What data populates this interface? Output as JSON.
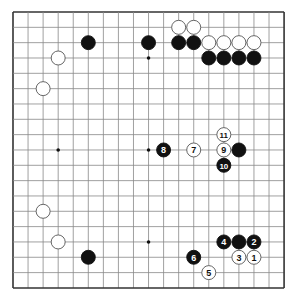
{
  "board": {
    "size": 19,
    "origin": {
      "x": 13,
      "y": 12
    },
    "spacing": {
      "x": 15.06,
      "y": 15.33
    },
    "colors": {
      "background": "#ffffff",
      "line": "#888888",
      "border": "#333333",
      "black": "#111111",
      "white": "#ffffff",
      "white_outline": "#555555"
    },
    "star_points": [
      [
        3,
        3
      ],
      [
        9,
        3
      ],
      [
        15,
        3
      ],
      [
        3,
        9
      ],
      [
        9,
        9
      ],
      [
        15,
        9
      ],
      [
        3,
        15
      ],
      [
        9,
        15
      ],
      [
        15,
        15
      ]
    ],
    "stones": [
      {
        "col": 5,
        "row": 2,
        "color": "black",
        "label": ""
      },
      {
        "col": 9,
        "row": 2,
        "color": "black",
        "label": ""
      },
      {
        "col": 3,
        "row": 3,
        "color": "white",
        "label": ""
      },
      {
        "col": 2,
        "row": 5,
        "color": "white",
        "label": ""
      },
      {
        "col": 11,
        "row": 1,
        "color": "white",
        "label": ""
      },
      {
        "col": 12,
        "row": 1,
        "color": "white",
        "label": ""
      },
      {
        "col": 11,
        "row": 2,
        "color": "black",
        "label": ""
      },
      {
        "col": 12,
        "row": 2,
        "color": "black",
        "label": ""
      },
      {
        "col": 13,
        "row": 2,
        "color": "white",
        "label": ""
      },
      {
        "col": 14,
        "row": 2,
        "color": "white",
        "label": ""
      },
      {
        "col": 15,
        "row": 2,
        "color": "white",
        "label": ""
      },
      {
        "col": 16,
        "row": 2,
        "color": "white",
        "label": ""
      },
      {
        "col": 13,
        "row": 3,
        "color": "black",
        "label": ""
      },
      {
        "col": 14,
        "row": 3,
        "color": "black",
        "label": ""
      },
      {
        "col": 15,
        "row": 3,
        "color": "black",
        "label": ""
      },
      {
        "col": 16,
        "row": 3,
        "color": "black",
        "label": ""
      },
      {
        "col": 10,
        "row": 9,
        "color": "black",
        "label": "8"
      },
      {
        "col": 12,
        "row": 9,
        "color": "white",
        "label": "7"
      },
      {
        "col": 14,
        "row": 9,
        "color": "white",
        "label": "9"
      },
      {
        "col": 14,
        "row": 8,
        "color": "white",
        "label": "11"
      },
      {
        "col": 15,
        "row": 9,
        "color": "black",
        "label": ""
      },
      {
        "col": 14,
        "row": 10,
        "color": "black",
        "label": "10"
      },
      {
        "col": 2,
        "row": 13,
        "color": "white",
        "label": ""
      },
      {
        "col": 3,
        "row": 15,
        "color": "white",
        "label": ""
      },
      {
        "col": 5,
        "row": 16,
        "color": "black",
        "label": ""
      },
      {
        "col": 14,
        "row": 15,
        "color": "black",
        "label": "4"
      },
      {
        "col": 15,
        "row": 15,
        "color": "black",
        "label": ""
      },
      {
        "col": 16,
        "row": 15,
        "color": "black",
        "label": "2"
      },
      {
        "col": 15,
        "row": 16,
        "color": "white",
        "label": "3"
      },
      {
        "col": 16,
        "row": 16,
        "color": "white",
        "label": "1"
      },
      {
        "col": 12,
        "row": 16,
        "color": "black",
        "label": "6"
      },
      {
        "col": 13,
        "row": 17,
        "color": "white",
        "label": "5"
      }
    ]
  }
}
